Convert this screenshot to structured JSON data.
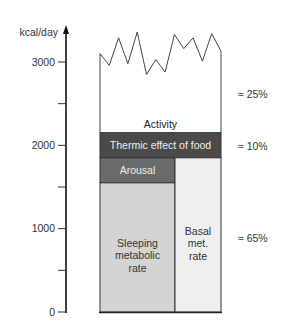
{
  "chart_data": {
    "type": "bar",
    "title": "",
    "ylabel": "kcal/day",
    "xlabel": "",
    "ylim": [
      0,
      3000
    ],
    "y_ticks": [
      {
        "value": 0,
        "label": "0"
      },
      {
        "value": 1000,
        "label": "1000"
      },
      {
        "value": 2000,
        "label": "2000"
      },
      {
        "value": 3000,
        "label": "3000"
      }
    ],
    "y_minor_ticks": [
      500,
      1500,
      2500
    ],
    "segments": [
      {
        "name": "Sleeping metabolic rate",
        "label_lines": [
          "Sleeping",
          "metabolic",
          "rate"
        ],
        "from": 0,
        "to": 1550,
        "color": "#d4d4d4",
        "text_color": "#333333"
      },
      {
        "name": "Basal met. rate",
        "label_lines": [
          "Basal",
          "met.",
          "rate"
        ],
        "from": 0,
        "to": 1850,
        "color": "#efefef",
        "text_color": "#333333"
      },
      {
        "name": "Arousal",
        "label_lines": [
          "Arousal"
        ],
        "from": 1550,
        "to": 1850,
        "color": "#6a6a6a",
        "text_color": "#eeeeee"
      },
      {
        "name": "Thermic effect of food",
        "label_lines": [
          "Thermic effect of food"
        ],
        "from": 1850,
        "to": 2150,
        "color": "#4a4a4a",
        "text_color": "#eeeeee"
      },
      {
        "name": "Activity",
        "label_lines": [
          "Activity"
        ],
        "from": 2150,
        "to": 3150,
        "color": "#ffffff",
        "text_color": "#222222",
        "variable_top": true
      }
    ],
    "activity_top_profile": [
      3100,
      2960,
      3290,
      2980,
      3360,
      2850,
      3030,
      2880,
      3330,
      3160,
      3290,
      3010,
      3340,
      3130
    ],
    "percent_annotations": [
      {
        "label": "≈ 25%",
        "group": "Activity",
        "value": 25
      },
      {
        "label": "≈ 10%",
        "group": "Thermic effect of food",
        "value": 10
      },
      {
        "label": "≈ 65%",
        "group": "Sleeping metabolic rate + Arousal / Basal met. rate",
        "value": 65
      }
    ]
  }
}
